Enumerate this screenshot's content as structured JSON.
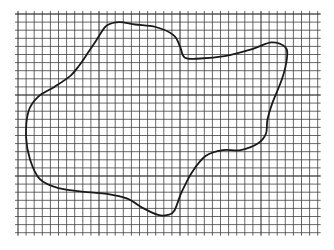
{
  "figure": {
    "grid": {
      "columns": 37,
      "rows": 27,
      "line_color": "#3a3a3a",
      "background": "#ffffff"
    },
    "shape": {
      "stroke_color": "#1a1a1a",
      "outline_points_grid_units": [
        [
          10.2,
          2.4
        ],
        [
          11.0,
          1.4
        ],
        [
          12.5,
          1.0
        ],
        [
          14.5,
          1.3
        ],
        [
          17.0,
          1.6
        ],
        [
          19.2,
          2.6
        ],
        [
          20.0,
          4.0
        ],
        [
          20.6,
          5.4
        ],
        [
          22.5,
          5.5
        ],
        [
          25.5,
          5.2
        ],
        [
          29.0,
          4.3
        ],
        [
          31.3,
          3.5
        ],
        [
          33.0,
          4.1
        ],
        [
          33.2,
          5.5
        ],
        [
          32.6,
          8.0
        ],
        [
          31.4,
          11.0
        ],
        [
          30.8,
          13.0
        ],
        [
          30.6,
          14.8
        ],
        [
          29.6,
          16.0
        ],
        [
          27.5,
          16.8
        ],
        [
          25.3,
          16.8
        ],
        [
          23.2,
          17.5
        ],
        [
          21.5,
          19.5
        ],
        [
          20.2,
          22.0
        ],
        [
          19.3,
          24.3
        ],
        [
          18.5,
          24.8
        ],
        [
          17.3,
          24.8
        ],
        [
          15.5,
          24.0
        ],
        [
          13.5,
          22.8
        ],
        [
          11.0,
          22.2
        ],
        [
          8.5,
          22.0
        ],
        [
          5.0,
          21.5
        ],
        [
          2.7,
          20.4
        ],
        [
          1.5,
          18.0
        ],
        [
          1.0,
          15.2
        ],
        [
          1.3,
          12.0
        ],
        [
          2.5,
          10.2
        ],
        [
          4.5,
          9.0
        ],
        [
          6.5,
          7.6
        ],
        [
          7.6,
          6.3
        ],
        [
          8.5,
          5.0
        ],
        [
          9.5,
          3.5
        ]
      ]
    }
  }
}
